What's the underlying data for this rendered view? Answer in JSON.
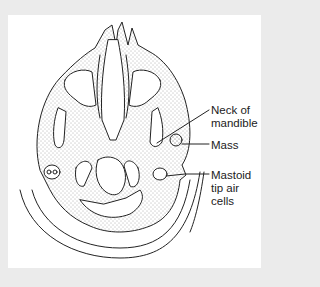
{
  "figure": {
    "type": "axial anatomical line drawing",
    "background_color": "#ebebeb",
    "panel_color": "#ffffff",
    "line_color": "#222222"
  },
  "labels": {
    "neck_of_mandible": {
      "line1": "Neck of",
      "line2": "mandible"
    },
    "mass": {
      "line1": "Mass"
    },
    "mastoid": {
      "line1": "Mastoid",
      "line2": "tip air",
      "line3": "cells"
    }
  }
}
